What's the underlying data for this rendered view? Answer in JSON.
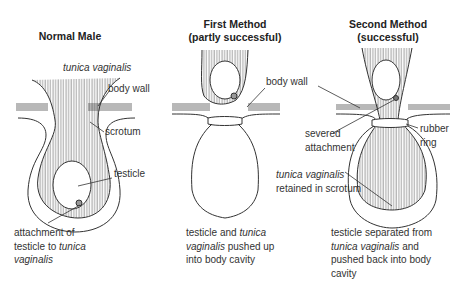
{
  "panels": [
    {
      "title": "Normal Male",
      "labels": {
        "tunica": "tunica vaginalis",
        "body_wall": "body wall",
        "scrotum": "scrotum",
        "testicle": "testicle"
      },
      "caption": {
        "line1": "attachment of",
        "line2a": "testicle to ",
        "line2b": "tunica",
        "line3": "vaginalis"
      }
    },
    {
      "title_line1": "First Method",
      "title_line2": "(partly successful)",
      "labels": {
        "body_wall": "body wall"
      },
      "caption": {
        "line1a": "testicle and ",
        "line1b": "tunica",
        "line2a": "vaginalis",
        "line2b": " pushed up",
        "line3": "into body cavity"
      }
    },
    {
      "title_line1": "Second Method",
      "title_line2": "(successful)",
      "labels": {
        "severed1": "severed",
        "severed2": "attachment",
        "rubber1": "rubber",
        "rubber2": "ring",
        "tunica1": "tunica vaginalis",
        "tunica2": "retained in scrotum"
      },
      "caption": {
        "line1": "testicle separated from",
        "line2a": "tunica vaginalis",
        "line2b": " and",
        "line3": "pushed back into body",
        "line4": "cavity"
      }
    }
  ]
}
